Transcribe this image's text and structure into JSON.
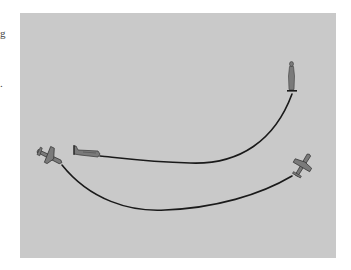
{
  "edge_text": {
    "fragment_top": "g",
    "fragment_mid": "."
  },
  "scene": {
    "background_color": "#c9c9c9",
    "line_color": "#1a1a1a",
    "figure_color": "#6e6e6e",
    "elements": [
      {
        "name": "standing-person",
        "description": "observer standing on ground"
      },
      {
        "name": "plane-horizontal",
        "description": "airplane seen from side, level"
      },
      {
        "name": "plane-diagonal-left",
        "description": "airplane seen from above, banking"
      },
      {
        "name": "plane-tilted-right",
        "description": "airplane seen tilted"
      },
      {
        "name": "upper-trajectory",
        "description": "curve from observer to level airplane"
      },
      {
        "name": "lower-trajectory",
        "description": "curve from left airplane to right airplane"
      }
    ]
  }
}
